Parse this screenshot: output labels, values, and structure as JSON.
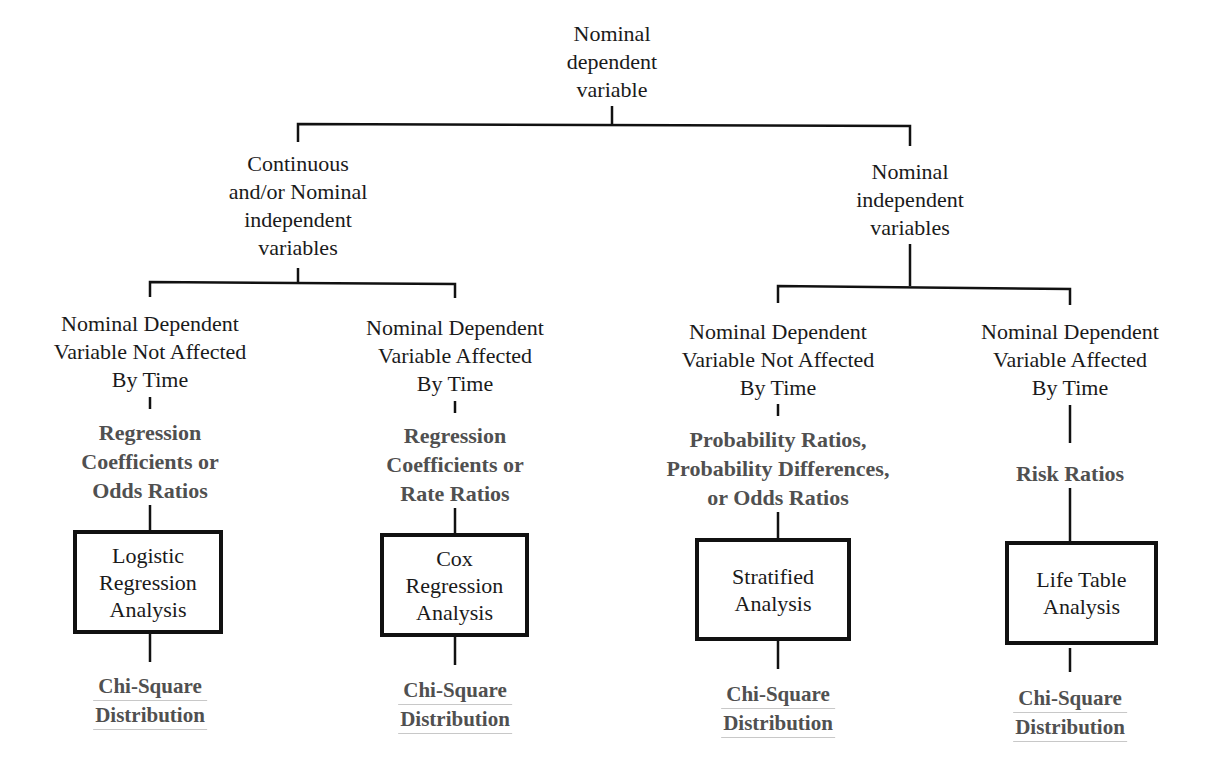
{
  "diagram": {
    "type": "decision-tree",
    "root": {
      "lines": [
        "Nominal",
        "dependent",
        "variable"
      ]
    },
    "branches": [
      {
        "label_lines": [
          "Continuous",
          "and/or Nominal",
          "independent",
          "variables"
        ],
        "leaves": [
          {
            "condition_lines": [
              "Nominal Dependent",
              "Variable Not Affected",
              "By Time"
            ],
            "measure_lines": [
              "Regression",
              "Coefficients or",
              "Odds Ratios"
            ],
            "method_lines": [
              "Logistic",
              "Regression",
              "Analysis"
            ],
            "distribution_lines": [
              "Chi-Square",
              "Distribution"
            ]
          },
          {
            "condition_lines": [
              "Nominal Dependent",
              "Variable Affected",
              "By Time"
            ],
            "measure_lines": [
              "Regression",
              "Coefficients or",
              "Rate Ratios"
            ],
            "method_lines": [
              "Cox",
              "Regression",
              "Analysis"
            ],
            "distribution_lines": [
              "Chi-Square",
              "Distribution"
            ]
          }
        ]
      },
      {
        "label_lines": [
          "Nominal",
          "independent",
          "variables"
        ],
        "leaves": [
          {
            "condition_lines": [
              "Nominal Dependent",
              "Variable Not Affected",
              "By Time"
            ],
            "measure_lines": [
              "Probability Ratios,",
              "Probability Differences,",
              "or Odds Ratios"
            ],
            "method_lines": [
              "Stratified",
              "Analysis"
            ],
            "distribution_lines": [
              "Chi-Square",
              "Distribution"
            ]
          },
          {
            "condition_lines": [
              "Nominal Dependent",
              "Variable Affected",
              "By Time"
            ],
            "measure_lines": [
              "Risk Ratios"
            ],
            "method_lines": [
              "Life Table",
              "Analysis"
            ],
            "distribution_lines": [
              "Chi-Square",
              "Distribution"
            ]
          }
        ]
      }
    ],
    "colors": {
      "line": "#111111",
      "text": "#1a1a1a",
      "bold_text": "#505050",
      "background": "#ffffff"
    }
  }
}
